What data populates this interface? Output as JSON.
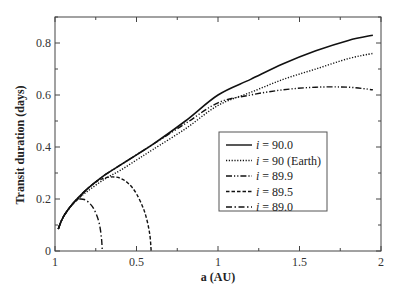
{
  "chart_data": {
    "type": "line",
    "title": "",
    "xlabel": "a (AU)",
    "ylabel": "Transit duration (days)",
    "xlim": [
      0,
      2
    ],
    "ylim": [
      0,
      0.9
    ],
    "grid": false,
    "legend_position": "inside-right",
    "x_ticks": [
      0,
      0.5,
      1,
      1.5,
      2
    ],
    "x_tick_labels": [
      "1",
      "0.5",
      "1",
      "1.5",
      "2"
    ],
    "y_ticks": [
      0,
      0.2,
      0.4,
      0.6,
      0.8
    ],
    "y_tick_labels": [
      "0",
      "0.2",
      "0.4",
      "0.6",
      "0.8"
    ],
    "series": [
      {
        "name": "i = 90.0",
        "style": "solid",
        "x": [
          0.02,
          0.05,
          0.1,
          0.15,
          0.2,
          0.3,
          0.4,
          0.5,
          0.6,
          0.8,
          1.0,
          1.2,
          1.4,
          1.6,
          1.8,
          1.95
        ],
        "y": [
          0.085,
          0.13,
          0.175,
          0.21,
          0.24,
          0.29,
          0.33,
          0.37,
          0.41,
          0.5,
          0.6,
          0.66,
          0.72,
          0.77,
          0.81,
          0.83
        ]
      },
      {
        "name": "i = 90 (Earth)",
        "style": "dotted",
        "x": [
          0.02,
          0.05,
          0.1,
          0.15,
          0.2,
          0.3,
          0.4,
          0.5,
          0.6,
          0.8,
          1.0,
          1.2,
          1.4,
          1.6,
          1.8,
          1.95
        ],
        "y": [
          0.085,
          0.13,
          0.175,
          0.205,
          0.23,
          0.275,
          0.31,
          0.35,
          0.39,
          0.47,
          0.56,
          0.61,
          0.66,
          0.7,
          0.74,
          0.76
        ]
      },
      {
        "name": "i = 89.9",
        "style": "dash-dot-dot",
        "x": [
          0.02,
          0.05,
          0.1,
          0.15,
          0.2,
          0.3,
          0.4,
          0.5,
          0.6,
          0.8,
          1.0,
          1.2,
          1.4,
          1.6,
          1.8,
          1.95
        ],
        "y": [
          0.085,
          0.13,
          0.175,
          0.21,
          0.24,
          0.29,
          0.33,
          0.37,
          0.41,
          0.49,
          0.57,
          0.6,
          0.62,
          0.63,
          0.63,
          0.62
        ]
      },
      {
        "name": "i = 89.5",
        "style": "dashed",
        "x": [
          0.02,
          0.05,
          0.1,
          0.15,
          0.2,
          0.25,
          0.3,
          0.35,
          0.4,
          0.45,
          0.5,
          0.55,
          0.58,
          0.59
        ],
        "y": [
          0.085,
          0.13,
          0.175,
          0.205,
          0.24,
          0.265,
          0.28,
          0.285,
          0.28,
          0.26,
          0.22,
          0.15,
          0.07,
          0.0
        ]
      },
      {
        "name": "i = 89.0",
        "style": "dash-dot",
        "x": [
          0.02,
          0.05,
          0.08,
          0.1,
          0.13,
          0.15,
          0.18,
          0.21,
          0.24,
          0.27,
          0.285,
          0.29
        ],
        "y": [
          0.085,
          0.13,
          0.16,
          0.175,
          0.195,
          0.2,
          0.198,
          0.185,
          0.16,
          0.11,
          0.05,
          0.0
        ]
      }
    ]
  }
}
